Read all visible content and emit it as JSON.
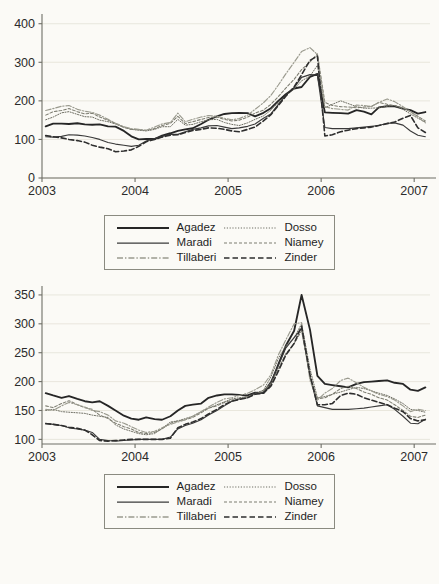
{
  "figure": {
    "panels": [
      "top-panel",
      "bottom-panel"
    ],
    "legend_entries": [
      {
        "label": "Agadez",
        "style": "solid-thick",
        "color": "#262626"
      },
      {
        "label": "Dosso",
        "style": "dotted-fine",
        "color": "#6f6f64"
      },
      {
        "label": "Maradi",
        "style": "solid-thin",
        "color": "#3a3a3a"
      },
      {
        "label": "Niamey",
        "style": "dashed-fine",
        "color": "#7c7c70"
      },
      {
        "label": "Tillaberi",
        "style": "dash-dot",
        "color": "#9a9a8e"
      },
      {
        "label": "Zinder",
        "style": "dashed-bold",
        "color": "#2e2e2e"
      }
    ],
    "legend_layout": {
      "columns": 2,
      "rows": 3,
      "col1": [
        "Agadez",
        "Maradi",
        "Tillaberi"
      ],
      "col2": [
        "Dosso",
        "Niamey",
        "Zinder"
      ]
    }
  },
  "chart_data": [
    {
      "id": "top-panel",
      "type": "line",
      "title": "",
      "xlabel": "",
      "ylabel": "",
      "xlim": [
        2003.0,
        2007.17
      ],
      "ylim": [
        0,
        420
      ],
      "yticks": [
        0,
        100,
        200,
        300,
        400
      ],
      "xticks": [
        2003,
        2004,
        2005,
        2006,
        2007
      ],
      "xticklabels": [
        "2003",
        "2004",
        "2005",
        "2006",
        "2007"
      ],
      "yticklabels": [
        "0",
        "100",
        "200",
        "300",
        "400"
      ],
      "grid": "horizontal",
      "legend_position": "below-outside",
      "x": [
        2003.04,
        2003.12,
        2003.21,
        2003.29,
        2003.38,
        2003.46,
        2003.54,
        2003.62,
        2003.71,
        2003.79,
        2003.88,
        2003.96,
        2004.04,
        2004.12,
        2004.21,
        2004.29,
        2004.38,
        2004.46,
        2004.54,
        2004.62,
        2004.71,
        2004.79,
        2004.88,
        2004.96,
        2005.04,
        2005.12,
        2005.21,
        2005.29,
        2005.38,
        2005.46,
        2005.54,
        2005.62,
        2005.71,
        2005.79,
        2005.88,
        2005.96,
        2006.04,
        2006.12,
        2006.21,
        2006.29,
        2006.38,
        2006.46,
        2006.54,
        2006.62,
        2006.71,
        2006.79,
        2006.88,
        2006.96,
        2007.04,
        2007.12
      ],
      "series": [
        {
          "name": "Agadez",
          "style": "solid-thick",
          "color": "#262626",
          "values": [
            134,
            141,
            141,
            140,
            142,
            139,
            138,
            139,
            134,
            133,
            122,
            108,
            100,
            101,
            101,
            110,
            116,
            122,
            126,
            129,
            140,
            151,
            160,
            166,
            168,
            169,
            168,
            160,
            169,
            181,
            200,
            217,
            232,
            236,
            262,
            270,
            170,
            169,
            168,
            167,
            176,
            172,
            165,
            183,
            186,
            186,
            180,
            176,
            167,
            171
          ]
        },
        {
          "name": "Dosso",
          "style": "dotted-fine",
          "color": "#6f6f64",
          "values": [
            151,
            158,
            169,
            172,
            165,
            159,
            158,
            150,
            146,
            140,
            132,
            126,
            124,
            122,
            126,
            133,
            133,
            152,
            137,
            139,
            146,
            151,
            152,
            144,
            139,
            136,
            143,
            152,
            161,
            176,
            196,
            214,
            231,
            252,
            264,
            292,
            182,
            191,
            200,
            193,
            185,
            181,
            181,
            182,
            186,
            188,
            178,
            166,
            155,
            145
          ]
        },
        {
          "name": "Maradi",
          "style": "solid-thin",
          "color": "#3a3a3a",
          "values": [
            107,
            106,
            108,
            112,
            111,
            109,
            105,
            100,
            92,
            88,
            85,
            82,
            85,
            96,
            102,
            108,
            113,
            113,
            120,
            126,
            130,
            135,
            136,
            132,
            128,
            130,
            134,
            140,
            155,
            166,
            191,
            215,
            235,
            261,
            268,
            267,
            131,
            128,
            128,
            128,
            130,
            132,
            134,
            136,
            142,
            143,
            137,
            122,
            111,
            107
          ]
        },
        {
          "name": "Niamey",
          "style": "dashed-fine",
          "color": "#7c7c70",
          "values": [
            163,
            172,
            175,
            180,
            172,
            166,
            168,
            158,
            150,
            141,
            131,
            126,
            125,
            123,
            128,
            136,
            142,
            160,
            141,
            146,
            152,
            157,
            158,
            152,
            148,
            150,
            158,
            168,
            176,
            191,
            211,
            233,
            256,
            281,
            301,
            322,
            196,
            188,
            185,
            184,
            182,
            184,
            186,
            196,
            191,
            188,
            182,
            172,
            160,
            148
          ]
        },
        {
          "name": "Tillaberi",
          "style": "dash-dot",
          "color": "#9a9a8e",
          "values": [
            175,
            180,
            186,
            188,
            178,
            173,
            170,
            163,
            152,
            142,
            133,
            128,
            126,
            124,
            132,
            140,
            144,
            168,
            146,
            152,
            158,
            162,
            160,
            155,
            151,
            154,
            163,
            178,
            195,
            214,
            241,
            270,
            300,
            328,
            338,
            320,
            185,
            180,
            178,
            176,
            189,
            188,
            185,
            196,
            205,
            198,
            185,
            172,
            158,
            143
          ]
        },
        {
          "name": "Zinder",
          "style": "dashed-bold",
          "color": "#2e2e2e",
          "values": [
            110,
            107,
            104,
            100,
            97,
            93,
            85,
            80,
            76,
            68,
            70,
            73,
            82,
            94,
            100,
            106,
            111,
            112,
            118,
            123,
            126,
            130,
            129,
            126,
            122,
            120,
            126,
            132,
            148,
            164,
            188,
            212,
            236,
            268,
            305,
            316,
            109,
            112,
            120,
            124,
            128,
            130,
            132,
            136,
            141,
            145,
            155,
            162,
            130,
            118
          ]
        }
      ]
    },
    {
      "id": "bottom-panel",
      "type": "line",
      "title": "",
      "xlabel": "",
      "ylabel": "",
      "xlim": [
        2003.0,
        2007.17
      ],
      "ylim": [
        92,
        362
      ],
      "yticks": [
        100,
        150,
        200,
        250,
        300,
        350
      ],
      "xticks": [
        2003,
        2004,
        2005,
        2006,
        2007
      ],
      "xticklabels": [
        "2003",
        "2004",
        "2005",
        "2006",
        "2007"
      ],
      "yticklabels": [
        "100",
        "150",
        "200",
        "250",
        "300",
        "350"
      ],
      "grid": "horizontal",
      "legend_position": "below-outside",
      "x": [
        2003.04,
        2003.12,
        2003.21,
        2003.29,
        2003.38,
        2003.46,
        2003.54,
        2003.62,
        2003.71,
        2003.79,
        2003.88,
        2003.96,
        2004.04,
        2004.12,
        2004.21,
        2004.29,
        2004.38,
        2004.46,
        2004.54,
        2004.62,
        2004.71,
        2004.79,
        2004.88,
        2004.96,
        2005.04,
        2005.12,
        2005.21,
        2005.29,
        2005.38,
        2005.46,
        2005.54,
        2005.62,
        2005.71,
        2005.79,
        2005.88,
        2005.96,
        2006.04,
        2006.12,
        2006.21,
        2006.29,
        2006.38,
        2006.46,
        2006.54,
        2006.62,
        2006.71,
        2006.79,
        2006.88,
        2006.96,
        2007.04,
        2007.12
      ],
      "series": [
        {
          "name": "Agadez",
          "style": "solid-thick",
          "color": "#262626",
          "values": [
            180,
            176,
            172,
            175,
            170,
            166,
            164,
            166,
            158,
            150,
            141,
            136,
            134,
            138,
            135,
            134,
            140,
            150,
            158,
            160,
            162,
            172,
            176,
            178,
            178,
            177,
            176,
            181,
            180,
            196,
            230,
            262,
            288,
            350,
            290,
            210,
            196,
            194,
            192,
            190,
            196,
            199,
            200,
            201,
            202,
            198,
            196,
            186,
            184,
            190
          ]
        },
        {
          "name": "Dosso",
          "style": "dotted-fine",
          "color": "#6f6f64",
          "values": [
            150,
            152,
            148,
            147,
            146,
            145,
            142,
            140,
            138,
            125,
            118,
            114,
            110,
            108,
            110,
            119,
            130,
            132,
            136,
            140,
            148,
            154,
            160,
            165,
            170,
            172,
            174,
            180,
            185,
            208,
            240,
            262,
            276,
            300,
            222,
            172,
            174,
            178,
            182,
            186,
            190,
            188,
            184,
            180,
            176,
            170,
            162,
            152,
            150,
            147
          ]
        },
        {
          "name": "Maradi",
          "style": "solid-thin",
          "color": "#3a3a3a",
          "values": [
            128,
            126,
            124,
            120,
            118,
            116,
            112,
            100,
            98,
            97,
            98,
            99,
            100,
            100,
            100,
            100,
            104,
            118,
            124,
            128,
            134,
            142,
            150,
            158,
            166,
            170,
            172,
            180,
            182,
            200,
            228,
            258,
            276,
            292,
            210,
            158,
            155,
            152,
            152,
            152,
            153,
            154,
            156,
            158,
            160,
            152,
            140,
            128,
            127,
            135
          ]
        },
        {
          "name": "Niamey",
          "style": "dashed-fine",
          "color": "#7c7c70",
          "values": [
            158,
            155,
            162,
            167,
            160,
            155,
            152,
            142,
            136,
            128,
            122,
            118,
            112,
            110,
            112,
            118,
            128,
            132,
            134,
            138,
            146,
            154,
            158,
            164,
            168,
            170,
            174,
            178,
            184,
            196,
            222,
            248,
            266,
            288,
            208,
            170,
            172,
            178,
            188,
            192,
            188,
            182,
            178,
            172,
            168,
            160,
            150,
            140,
            138,
            142
          ]
        },
        {
          "name": "Tillaberi",
          "style": "dash-dot",
          "color": "#9a9a8e",
          "values": [
            152,
            150,
            158,
            164,
            160,
            156,
            150,
            148,
            142,
            132,
            128,
            122,
            116,
            112,
            114,
            120,
            126,
            130,
            134,
            140,
            148,
            156,
            164,
            170,
            172,
            176,
            180,
            186,
            194,
            212,
            246,
            272,
            300,
            302,
            202,
            168,
            180,
            188,
            202,
            206,
            198,
            190,
            184,
            178,
            174,
            168,
            158,
            148,
            152,
            150
          ]
        },
        {
          "name": "Zinder",
          "style": "dashed-bold",
          "color": "#2e2e2e",
          "values": [
            127,
            126,
            124,
            121,
            119,
            116,
            108,
            98,
            97,
            98,
            99,
            100,
            100,
            100,
            100,
            100,
            102,
            120,
            126,
            130,
            136,
            144,
            152,
            160,
            166,
            169,
            172,
            178,
            180,
            192,
            218,
            246,
            266,
            296,
            212,
            160,
            160,
            162,
            176,
            180,
            178,
            172,
            168,
            164,
            160,
            154,
            148,
            136,
            132,
            134
          ]
        }
      ]
    }
  ]
}
